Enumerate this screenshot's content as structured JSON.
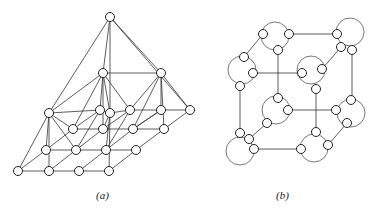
{
  "figure": {
    "panels": [
      {
        "id": "a",
        "caption": "(a)",
        "description": "Pyramid-like layered lattice graph: a single apex node connected to a two-node level, above a sheared 4x4 grid lattice of nodes",
        "node_radius": 4.5,
        "nodes": [
          [
            110,
            17
          ],
          [
            103,
            73
          ],
          [
            161,
            73
          ],
          [
            49,
            113
          ],
          [
            100,
            110
          ],
          [
            110,
            113
          ],
          [
            130,
            110
          ],
          [
            161,
            110
          ],
          [
            190,
            110
          ],
          [
            73,
            129
          ],
          [
            103,
            129
          ],
          [
            133,
            129
          ],
          [
            164,
            129
          ],
          [
            46,
            150
          ],
          [
            76,
            150
          ],
          [
            106,
            150
          ],
          [
            136,
            150
          ],
          [
            18,
            171
          ],
          [
            49,
            171
          ],
          [
            79,
            171
          ],
          [
            109,
            171
          ]
        ],
        "edges": [
          [
            0,
            1
          ],
          [
            0,
            2
          ],
          [
            0,
            3
          ],
          [
            0,
            5
          ],
          [
            0,
            8
          ],
          [
            1,
            2
          ],
          [
            1,
            3
          ],
          [
            1,
            4
          ],
          [
            1,
            5
          ],
          [
            1,
            6
          ],
          [
            1,
            9
          ],
          [
            1,
            10
          ],
          [
            2,
            7
          ],
          [
            2,
            8
          ],
          [
            2,
            6
          ],
          [
            2,
            11
          ],
          [
            2,
            12
          ],
          [
            3,
            4
          ],
          [
            4,
            5
          ],
          [
            5,
            6
          ],
          [
            6,
            7
          ],
          [
            7,
            8
          ],
          [
            3,
            13
          ],
          [
            3,
            14
          ],
          [
            3,
            17
          ],
          [
            3,
            9
          ],
          [
            9,
            10
          ],
          [
            10,
            11
          ],
          [
            11,
            12
          ],
          [
            13,
            14
          ],
          [
            14,
            15
          ],
          [
            15,
            16
          ],
          [
            17,
            18
          ],
          [
            18,
            19
          ],
          [
            19,
            20
          ],
          [
            17,
            13
          ],
          [
            13,
            9
          ],
          [
            9,
            4
          ],
          [
            18,
            14
          ],
          [
            14,
            10
          ],
          [
            10,
            6
          ],
          [
            19,
            15
          ],
          [
            15,
            11
          ],
          [
            11,
            7
          ],
          [
            20,
            16
          ],
          [
            16,
            12
          ],
          [
            12,
            8
          ],
          [
            3,
            18
          ],
          [
            5,
            20
          ],
          [
            5,
            10
          ],
          [
            4,
            14
          ],
          [
            6,
            15
          ],
          [
            7,
            11
          ],
          [
            5,
            15
          ]
        ]
      },
      {
        "id": "b",
        "caption": "(b)",
        "description": "Cube-shaped graph where each of the 8 cube corners is replaced by a cluster of 3 small nodes enclosed by a larger circular arc",
        "node_radius": 4.5,
        "cluster_arc_radius": 14,
        "clusters": [
          {
            "name": "top-back-left",
            "arc": [
              275,
              36
            ],
            "nodes": [
              [
                263,
                34
              ],
              [
                289,
                34
              ],
              [
                278,
                50
              ]
            ]
          },
          {
            "name": "top-back-right",
            "arc": [
              350,
              32
            ],
            "nodes": [
              [
                337,
                34
              ],
              [
                341,
                47
              ],
              [
                352,
                50
              ]
            ]
          },
          {
            "name": "top-front-left",
            "arc": [
              242,
              70
            ],
            "nodes": [
              [
                244,
                57
              ],
              [
                253,
                73
              ],
              [
                240,
                86
              ]
            ]
          },
          {
            "name": "top-front-right",
            "arc": [
              311,
              70
            ],
            "nodes": [
              [
                302,
                73
              ],
              [
                322,
                69
              ],
              [
                316,
                89
              ]
            ]
          },
          {
            "name": "bottom-back-left",
            "arc": [
              276,
              110
            ],
            "nodes": [
              [
                278,
                98
              ],
              [
                288,
                110
              ],
              [
                267,
                123
              ]
            ]
          },
          {
            "name": "bottom-back-right",
            "arc": [
              351,
              113
            ],
            "nodes": [
              [
                336,
                110
              ],
              [
                351,
                100
              ],
              [
                347,
                123
              ]
            ]
          },
          {
            "name": "bottom-front-left",
            "arc": [
              240,
              151
            ],
            "nodes": [
              [
                240,
                133
              ],
              [
                249,
                139
              ],
              [
                254,
                149
              ]
            ]
          },
          {
            "name": "bottom-front-right",
            "arc": [
              314,
              148
            ],
            "nodes": [
              [
                301,
                149
              ],
              [
                316,
                132
              ],
              [
                328,
                145
              ]
            ]
          }
        ],
        "edges": [
          [
            [
              289,
              34
            ],
            [
              337,
              34
            ]
          ],
          [
            [
              263,
              34
            ],
            [
              244,
              57
            ]
          ],
          [
            [
              278,
              50
            ],
            [
              278,
              98
            ]
          ],
          [
            [
              341,
              47
            ],
            [
              322,
              69
            ]
          ],
          [
            [
              352,
              50
            ],
            [
              352,
              100
            ]
          ],
          [
            [
              253,
              73
            ],
            [
              302,
              73
            ]
          ],
          [
            [
              240,
              86
            ],
            [
              240,
              133
            ]
          ],
          [
            [
              316,
              89
            ],
            [
              316,
              132
            ]
          ],
          [
            [
              288,
              110
            ],
            [
              336,
              110
            ]
          ],
          [
            [
              267,
              123
            ],
            [
              249,
              139
            ]
          ],
          [
            [
              347,
              123
            ],
            [
              328,
              145
            ]
          ],
          [
            [
              254,
              149
            ],
            [
              301,
              149
            ]
          ]
        ]
      }
    ]
  }
}
